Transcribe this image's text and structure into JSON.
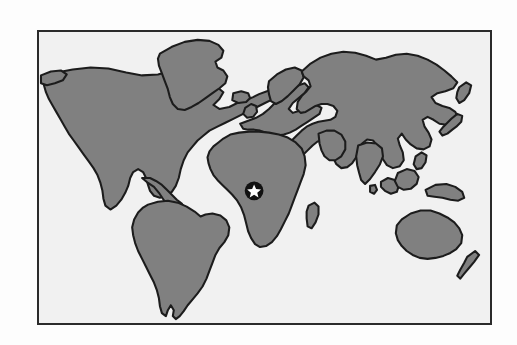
{
  "figure": {
    "type": "world-map",
    "projection": "equirectangular",
    "frame": {
      "border_color": "#2b2b2b",
      "border_width_px": 2,
      "x": 37,
      "y": 30,
      "width": 455,
      "height": 295
    },
    "colors": {
      "page_background": "#fdfdfd",
      "ocean_background": "#f1f1f1",
      "land_fill": "#808080",
      "land_outline": "#1c1c1c",
      "marker_disc": "#111111",
      "marker_star": "#ffffff"
    }
  },
  "marker": {
    "name": "location-star-marker",
    "shape": "black-filled-circle-with-white-five-point-star",
    "region_label": "West Africa",
    "position_px": {
      "x": 254,
      "y": 191
    },
    "radius_px": 10
  },
  "landmasses": [
    {
      "name": "North America"
    },
    {
      "name": "South America"
    },
    {
      "name": "Greenland"
    },
    {
      "name": "Iceland"
    },
    {
      "name": "Europe"
    },
    {
      "name": "Africa"
    },
    {
      "name": "Asia"
    },
    {
      "name": "Madagascar"
    },
    {
      "name": "Indonesia"
    },
    {
      "name": "Philippines"
    },
    {
      "name": "New Guinea"
    },
    {
      "name": "Australia"
    },
    {
      "name": "New Zealand"
    },
    {
      "name": "Japan"
    },
    {
      "name": "United Kingdom"
    },
    {
      "name": "Sri Lanka"
    }
  ]
}
